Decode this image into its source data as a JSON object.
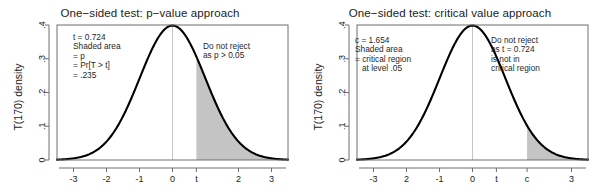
{
  "figure": {
    "background": "#ffffff",
    "curve_color": "#000000",
    "shade_color": "#c4c4c4",
    "axis_color": "#6e6e6e",
    "center_line_color": "#bdbdbd"
  },
  "panels": [
    {
      "id": "left",
      "title": "One−sided test: p−value approach",
      "ylabel": "T(170) density",
      "xticks": [
        "-3",
        "-2",
        "-1",
        "0",
        "t",
        "2",
        "3"
      ],
      "xtick_values": [
        -3,
        -2,
        -1,
        0,
        0.724,
        2,
        3
      ],
      "yticks": [
        ".4",
        ".3",
        ".2",
        ".1",
        "0"
      ],
      "ytick_values": [
        0.4,
        0.3,
        0.2,
        0.1,
        0
      ],
      "shade_from": 0.724,
      "annotation_left": [
        "t = 0.724",
        "Shaded area",
        "= p",
        "= Pr[T > t]",
        "= .235"
      ],
      "annotation_right": [
        "Do not reject",
        "as p > 0.05"
      ]
    },
    {
      "id": "right",
      "title": "One−sided test: critical value approach",
      "ylabel": "T(170) density",
      "xticks": [
        "-3",
        "2",
        "-1",
        "0",
        "t",
        "c",
        "3"
      ],
      "xtick_values": [
        -3,
        -2,
        -1,
        0,
        0.724,
        1.654,
        3
      ],
      "yticks": [
        ".4",
        ".3",
        ".2",
        ".1",
        "0"
      ],
      "ytick_values": [
        0.4,
        0.3,
        0.2,
        0.1,
        0
      ],
      "shade_from": 1.654,
      "annotation_left": [
        "c = 1.654",
        "Shaded area",
        "= critical region",
        "   at level .05"
      ],
      "annotation_right": [
        "Do not reject",
        "as t = 0.724",
        "is not in",
        "critical region"
      ]
    }
  ],
  "chart_data": {
    "type": "line",
    "distribution": "Student t",
    "degrees_of_freedom": 170,
    "xlabel": "",
    "ylabel": "T(170) density",
    "xlim": [
      -3.5,
      3.5
    ],
    "ylim": [
      0,
      0.4
    ],
    "grid": false,
    "legend": "none",
    "t_statistic": 0.724,
    "critical_value": 1.654,
    "p_value": 0.235,
    "alpha": 0.05,
    "conclusion": "Do not reject",
    "x": [
      -3.5,
      -3.25,
      -3,
      -2.75,
      -2.5,
      -2.25,
      -2,
      -1.75,
      -1.5,
      -1.25,
      -1,
      -0.75,
      -0.5,
      -0.25,
      0,
      0.25,
      0.5,
      0.75,
      1,
      1.25,
      1.5,
      1.75,
      2,
      2.25,
      2.5,
      2.75,
      3,
      3.25,
      3.5
    ],
    "series": [
      {
        "name": "T(170) density",
        "values": [
          0.0013,
          0.0026,
          0.0051,
          0.0096,
          0.0176,
          0.0311,
          0.0531,
          0.0866,
          0.1298,
          0.1827,
          0.2404,
          0.2968,
          0.3459,
          0.3827,
          0.3965,
          0.3827,
          0.3459,
          0.2968,
          0.2404,
          0.1827,
          0.1298,
          0.0866,
          0.0531,
          0.0311,
          0.0176,
          0.0096,
          0.0051,
          0.0026,
          0.0013
        ]
      }
    ],
    "shaded_regions": [
      {
        "panel": "left",
        "label": "p-value area",
        "from": 0.724,
        "to": 3.5,
        "area": 0.235
      },
      {
        "panel": "right",
        "label": "critical region",
        "from": 1.654,
        "to": 3.5,
        "area": 0.05
      }
    ]
  }
}
